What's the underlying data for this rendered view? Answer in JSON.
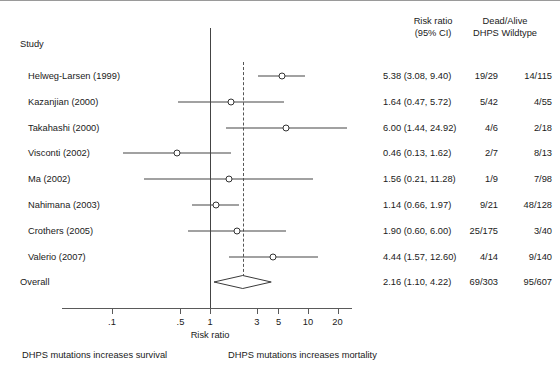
{
  "headers": {
    "study": "Study",
    "risk_ratio_line1": "Risk ratio",
    "risk_ratio_line2": "(95% CI)",
    "counts_line1": "Dead/Alive",
    "counts_line2": "DHPS Wildtype"
  },
  "footer": {
    "left": "DHPS mutations increases survival",
    "right": "DHPS mutations increases mortality"
  },
  "chart_data": {
    "type": "forest",
    "title": "",
    "xlabel": "Risk ratio",
    "ylabel": "",
    "scale": "log",
    "xlim": [
      0.075,
      28
    ],
    "null_value": 1,
    "grid": false,
    "tick_values": [
      0.1,
      0.5,
      1,
      3,
      5,
      10,
      20
    ],
    "tick_labels": [
      ".1",
      ".5",
      "1",
      "3",
      "5",
      "10",
      "20"
    ],
    "columns": [
      "Study",
      "Risk ratio (95% CI)",
      "Dead/Alive DHPS",
      "Dead/Alive Wildtype"
    ],
    "rows": [
      {
        "study": "Helweg-Larsen (1999)",
        "rr": 5.38,
        "lower": 3.08,
        "upper": 9.4,
        "rr_text": "5.38 (3.08, 9.40)",
        "events_dhps": "19/29",
        "events_wildtype": "14/115"
      },
      {
        "study": "Kazanjian (2000)",
        "rr": 1.64,
        "lower": 0.47,
        "upper": 5.72,
        "rr_text": "1.64 (0.47, 5.72)",
        "events_dhps": "5/42",
        "events_wildtype": "4/55"
      },
      {
        "study": "Takahashi (2000)",
        "rr": 6.0,
        "lower": 1.44,
        "upper": 24.92,
        "rr_text": "6.00 (1.44, 24.92)",
        "events_dhps": "4/6",
        "events_wildtype": "2/18"
      },
      {
        "study": "Visconti (2002)",
        "rr": 0.46,
        "lower": 0.13,
        "upper": 1.62,
        "rr_text": "0.46 (0.13, 1.62)",
        "events_dhps": "2/7",
        "events_wildtype": "8/13"
      },
      {
        "study": "Ma (2002)",
        "rr": 1.56,
        "lower": 0.21,
        "upper": 11.28,
        "rr_text": "1.56 (0.21, 11.28)",
        "events_dhps": "1/9",
        "events_wildtype": "7/98"
      },
      {
        "study": "Nahimana (2003)",
        "rr": 1.14,
        "lower": 0.66,
        "upper": 1.97,
        "rr_text": "1.14 (0.66, 1.97)",
        "events_dhps": "9/21",
        "events_wildtype": "48/128"
      },
      {
        "study": "Crothers (2005)",
        "rr": 1.9,
        "lower": 0.6,
        "upper": 6.0,
        "rr_text": "1.90 (0.60, 6.00)",
        "events_dhps": "25/175",
        "events_wildtype": "3/40"
      },
      {
        "study": "Valerio (2007)",
        "rr": 4.44,
        "lower": 1.57,
        "upper": 12.6,
        "rr_text": "4.44 (1.57, 12.60)",
        "events_dhps": "4/14",
        "events_wildtype": "9/140"
      }
    ],
    "overall": {
      "study": "Overall",
      "rr": 2.16,
      "lower": 1.1,
      "upper": 4.22,
      "rr_text": "2.16 (1.10, 4.22)",
      "events_dhps": "69/303",
      "events_wildtype": "95/607"
    }
  },
  "colors": {
    "line": "#444444",
    "marker_stroke": "#333333",
    "axis": "#5a5a5a",
    "text": "#1a1a1a"
  }
}
